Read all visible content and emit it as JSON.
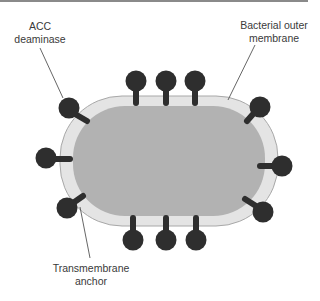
{
  "diagram": {
    "labels": {
      "acc": {
        "line1": "ACC",
        "line2": "deaminase"
      },
      "membrane": {
        "line1": "Bacterial outer",
        "line2": "membrane"
      },
      "anchor": {
        "line1": "Transmembrane",
        "line2": "anchor"
      }
    },
    "colors": {
      "background": "#ffffff",
      "outer_membrane": "#e4e4e4",
      "membrane_edge": "#a8a8a8",
      "cytoplasm": "#b2b2b2",
      "protein": "#2e2e2e",
      "leader_line": "#555555"
    },
    "protein_count": 12
  }
}
